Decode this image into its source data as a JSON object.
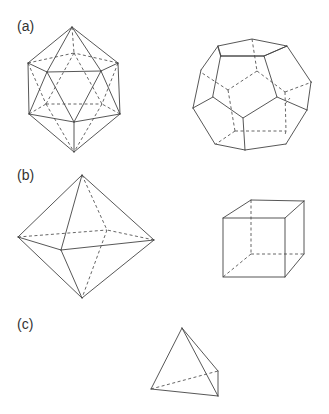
{
  "figure": {
    "panels": [
      {
        "label": "(a)",
        "solids": [
          "icosahedron",
          "dodecahedron"
        ]
      },
      {
        "label": "(b)",
        "solids": [
          "octahedron",
          "cube"
        ]
      },
      {
        "label": "(c)",
        "solids": [
          "tetrahedron"
        ]
      }
    ],
    "line_color": "#444444",
    "background": "#ffffff",
    "hidden_edges_style": "dashed"
  }
}
